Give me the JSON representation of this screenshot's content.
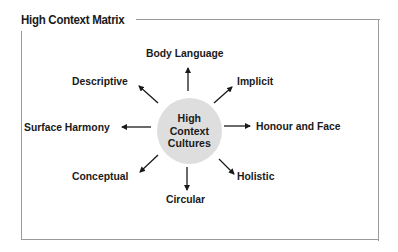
{
  "title": "High Context Matrix",
  "hub": {
    "lines": [
      "High",
      "Context",
      "Cultures"
    ],
    "fill": "#dedede"
  },
  "labels": {
    "top": "Body Language",
    "top_right": "Implicit",
    "right": "Honour and Face",
    "bottom_right": "Holistic",
    "bottom": "Circular",
    "bottom_left": "Conceptual",
    "left": "Surface Harmony",
    "top_left": "Descriptive"
  },
  "colors": {
    "frame": "#9a9a9a",
    "text": "#1a1a1a",
    "arrow": "#1a1a1a"
  }
}
